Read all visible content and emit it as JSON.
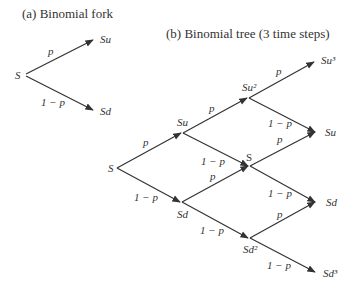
{
  "fork": {
    "title": "(a) Binomial fork",
    "root": "S",
    "up_node": "Su",
    "down_node": "Sd",
    "up_prob": "p",
    "down_prob": "1 − p"
  },
  "tree": {
    "title": "(b) Binomial tree (3 time steps)",
    "nodes": {
      "root": "S",
      "step1_up": "Su",
      "step1_down": "Sd",
      "step2_up": "Su²",
      "step2_mid": "S",
      "step2_down": "Sd²",
      "step3_top": "Su³",
      "step3_upper_mid": "Su",
      "step3_lower_mid": "Sd",
      "step3_bottom": "Sd³"
    },
    "edge_labels": {
      "root_up": "p",
      "root_down": "1 − p",
      "su_up": "p",
      "su_down": "1 − p",
      "sd_up": "p",
      "sd_down": "1 − p",
      "su2_up": "p",
      "su2_down": "1 − p",
      "smid_up": "p",
      "smid_down": "1 − p",
      "sd2_up": "p",
      "sd2_down": "1 − p"
    }
  }
}
